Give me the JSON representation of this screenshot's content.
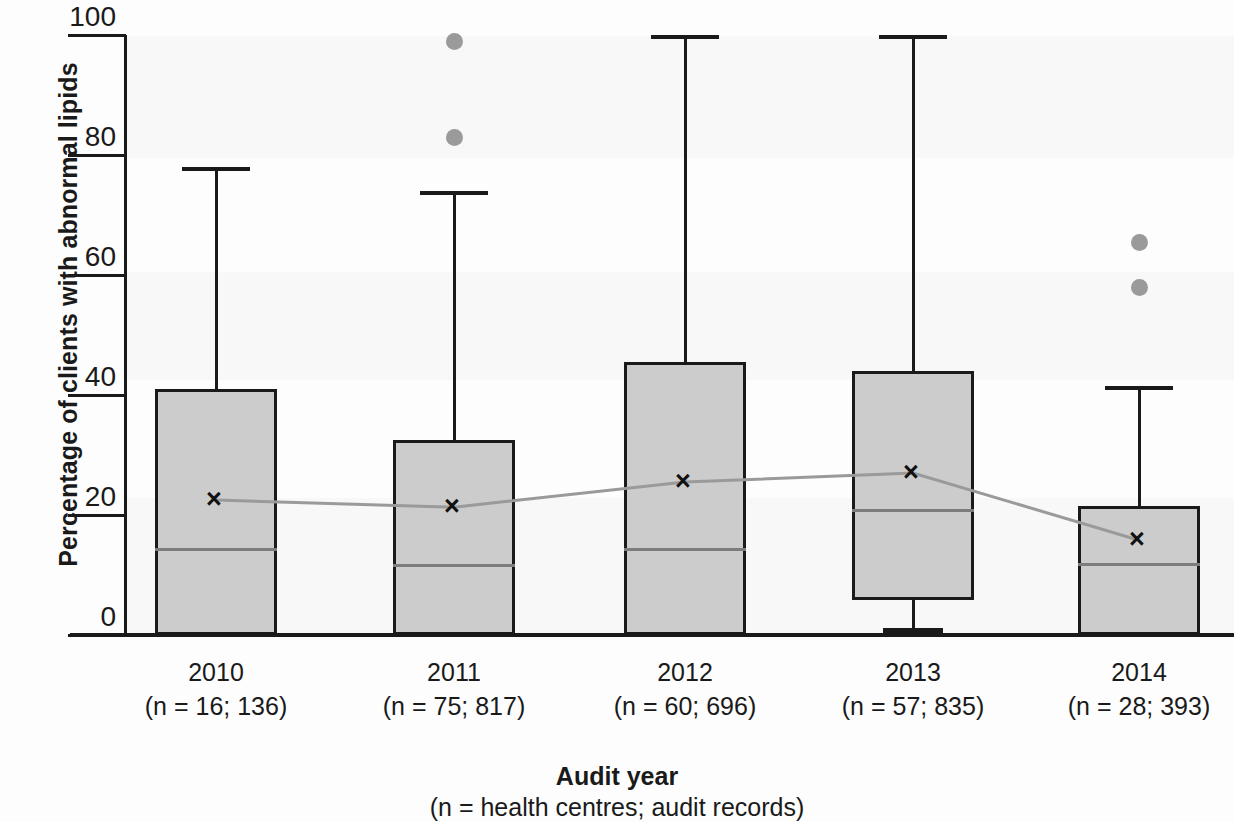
{
  "chart_data": {
    "type": "box",
    "title": "",
    "xlabel": "Audit year",
    "xlabel_sub": "(n = health centres; audit records)",
    "ylabel": "Percentage of clients with abnormal lipids",
    "ylim": [
      0,
      100
    ],
    "yticks": [
      0,
      20,
      40,
      60,
      80,
      100
    ],
    "grid": false,
    "legend": "none",
    "categories": [
      "2010",
      "2011",
      "2012",
      "2013",
      "2014"
    ],
    "category_sublabels": [
      "(n = 16; 136)",
      "(n = 75; 817)",
      "(n = 60; 696)",
      "(n = 57; 835)",
      "(n = 28; 393)"
    ],
    "n_health_centres": [
      16,
      75,
      60,
      57,
      28
    ],
    "n_audit_records": [
      136,
      817,
      696,
      835,
      393
    ],
    "boxes": [
      {
        "category": "2010",
        "whisker_low": 0,
        "q1": 0,
        "median": 14.5,
        "q3": 41.0,
        "whisker_high": 78.0,
        "mean": 22.5,
        "outliers": []
      },
      {
        "category": "2011",
        "whisker_low": 0,
        "q1": 0,
        "median": 11.8,
        "q3": 32.5,
        "whisker_high": 74.0,
        "mean": 21.3,
        "outliers": [
          99.0,
          83.0
        ]
      },
      {
        "category": "2012",
        "whisker_low": 0,
        "q1": 0,
        "median": 14.5,
        "q3": 45.5,
        "whisker_high": 100.0,
        "mean": 25.5,
        "outliers": []
      },
      {
        "category": "2013",
        "whisker_low": 0,
        "q1": 5.8,
        "median": 21.0,
        "q3": 44.0,
        "whisker_high": 100.0,
        "mean": 27.0,
        "outliers": []
      },
      {
        "category": "2014",
        "whisker_low": 0,
        "q1": 0,
        "median": 12.0,
        "q3": 21.5,
        "whisker_high": 41.5,
        "mean": 15.8,
        "outliers": [
          65.5,
          58.0
        ]
      }
    ],
    "mean_series": {
      "name": "mean",
      "values": [
        22.5,
        21.3,
        25.5,
        27.0,
        15.8
      ]
    },
    "colors": {
      "box_fill": "#cccccc",
      "box_border": "#1a1a1a",
      "median_line": "#7d7d7d",
      "mean_line": "#9a9a9a",
      "outlier": "#9a9a9a",
      "text": "#1a1a1a"
    },
    "mean_marker": "×"
  }
}
